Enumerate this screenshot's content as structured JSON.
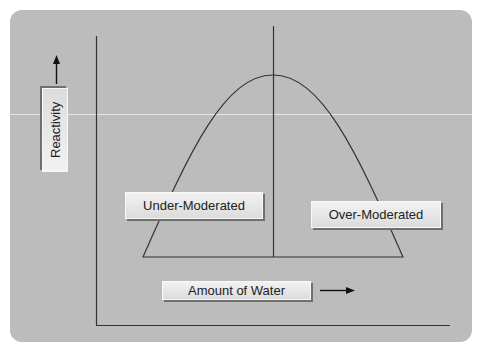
{
  "diagram": {
    "y_axis_label": "Reactivity",
    "x_axis_label": "Amount of Water",
    "regions": [
      {
        "label": "Under-Moderated",
        "side": "left of peak"
      },
      {
        "label": "Over-Moderated",
        "side": "right of peak"
      }
    ],
    "icons": {
      "y_arrow": "arrow-up-icon",
      "x_arrow": "arrow-right-icon"
    },
    "colors": {
      "panel_background": "#bcbcbc",
      "line": "#333333",
      "label_fill": "#e8e8e8"
    }
  }
}
